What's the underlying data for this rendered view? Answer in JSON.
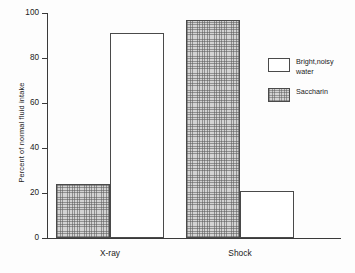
{
  "chart_data": {
    "type": "bar",
    "title": "",
    "subtitle": "",
    "xlabel": "",
    "ylabel": "Percent of normal fluid intake",
    "categories": [
      "X-ray",
      "Shock"
    ],
    "series": [
      {
        "name": "Saccharin",
        "values": [
          24,
          97
        ],
        "fill": "hatched",
        "order_in_group": 0
      },
      {
        "name": "Bright,noisy water",
        "values": [
          91,
          21
        ],
        "fill": "white",
        "order_in_group": 1
      }
    ],
    "ylim": [
      0,
      100
    ],
    "yticks": [
      0,
      20,
      40,
      60,
      80,
      100
    ],
    "ytick_labels": [
      "0",
      "20",
      "40",
      "60",
      "80",
      "100"
    ],
    "grid": false,
    "legend_position": "right",
    "legend": [
      {
        "label_line1": "Bright,noisy",
        "label_line2": "water",
        "fill": "white"
      },
      {
        "label_line1": "Saccharin",
        "label_line2": "",
        "fill": "hatched"
      }
    ],
    "colors": {
      "axis": "#3a3a3a",
      "bar_outline": "#4a4a4a",
      "hatched_fill": "#d3d3d3",
      "white_fill": "#ffffff",
      "background": "#fdfdfd",
      "text": "#1a1a1a"
    }
  }
}
